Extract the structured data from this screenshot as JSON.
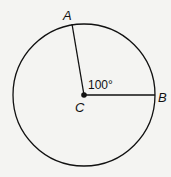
{
  "diagram": {
    "type": "circle-central-angle",
    "points": {
      "A": {
        "label": "A"
      },
      "B": {
        "label": "B"
      },
      "C": {
        "label": "C"
      }
    },
    "angle_label": "100°",
    "colors": {
      "stroke": "#111111",
      "background": "#f4f4f2"
    }
  }
}
